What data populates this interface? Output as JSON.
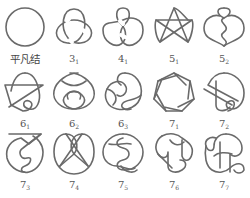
{
  "figure": {
    "layout": {
      "rows": 3,
      "columns": 5
    },
    "knots": [
      {
        "label": "平凡结",
        "number": "",
        "index": "",
        "shape": "unknot"
      },
      {
        "label": "3",
        "number": "3",
        "index": "1",
        "shape": "trefoil"
      },
      {
        "label": "4",
        "number": "4",
        "index": "1",
        "shape": "figure-eight"
      },
      {
        "label": "5",
        "number": "5",
        "index": "1",
        "shape": "cinquefoil"
      },
      {
        "label": "5",
        "number": "5",
        "index": "2",
        "shape": "three-twist"
      },
      {
        "label": "6",
        "number": "6",
        "index": "1",
        "shape": "stevedore"
      },
      {
        "label": "6",
        "number": "6",
        "index": "2",
        "shape": "6_2"
      },
      {
        "label": "6",
        "number": "6",
        "index": "3",
        "shape": "6_3"
      },
      {
        "label": "7",
        "number": "7",
        "index": "1",
        "shape": "septafoil"
      },
      {
        "label": "7",
        "number": "7",
        "index": "2",
        "shape": "7_2"
      },
      {
        "label": "7",
        "number": "7",
        "index": "3",
        "shape": "7_3"
      },
      {
        "label": "7",
        "number": "7",
        "index": "4",
        "shape": "7_4"
      },
      {
        "label": "7",
        "number": "7",
        "index": "5",
        "shape": "7_5"
      },
      {
        "label": "7",
        "number": "7",
        "index": "6",
        "shape": "7_6"
      },
      {
        "label": "7",
        "number": "7",
        "index": "7",
        "shape": "7_7"
      }
    ],
    "colors": {
      "stroke": "#6a6a6a",
      "text": "#555555",
      "background": "#ffffff"
    }
  }
}
